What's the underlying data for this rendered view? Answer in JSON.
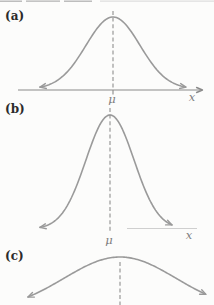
{
  "figure": {
    "background": "#fcfcfb",
    "curve_color": "#9a9a9a",
    "dash_color": "#8f8f8f",
    "axis_color": "#8a8a8a",
    "faint_axis_color": "#cfcfcf",
    "panel_label_color": "#2b2b2b",
    "symbol_color": "#7e7e7e",
    "top_crop_mark_color": "#b2b2b2",
    "top_crop_mark_faint_color": "#dedede"
  },
  "chart_data": {
    "type": "line",
    "title": "",
    "panels": [
      {
        "id": "a",
        "label": "(a)",
        "mu_label": "μ",
        "x_axis_label": "x",
        "relative_spread": "medium",
        "gauss": {
          "mean_x": 113,
          "sigma": 27,
          "peak_y": 17,
          "base_y": 89,
          "x_min": 40,
          "x_max": 186
        },
        "dashed": {
          "x": 113,
          "y1": 11,
          "y2": 90
        },
        "axis": {
          "x1": 18,
          "x2": 201,
          "y": 90,
          "tick_x": 113,
          "style": "solid",
          "arrow": true
        }
      },
      {
        "id": "b",
        "label": "(b)",
        "mu_label": "μ",
        "x_axis_label": "x",
        "relative_spread": "small (tall, narrow)",
        "gauss": {
          "mean_x": 110,
          "sigma": 24,
          "peak_y": 115,
          "base_y": 229,
          "x_min": 40,
          "x_max": 172
        },
        "dashed": {
          "x": 110,
          "y1": 108,
          "y2": 232
        },
        "axis": {
          "x1": 127,
          "x2": 197,
          "y": 228.5,
          "tick_x": null,
          "style": "faint",
          "arrow": false
        }
      },
      {
        "id": "c",
        "label": "(c)",
        "mu_label": "",
        "x_axis_label": "",
        "relative_spread": "large (low, wide; bottom cropped)",
        "gauss": {
          "mean_x": 120,
          "sigma": 56,
          "peak_y": 257,
          "base_y": 311,
          "x_min": 28,
          "x_max": 206
        },
        "dashed": {
          "x": 120,
          "y1": 262,
          "y2": 305
        },
        "axis": null
      }
    ]
  },
  "top_crop_marks": [
    {
      "x1": 0,
      "x2": 22,
      "faint": false
    },
    {
      "x1": 26,
      "x2": 60,
      "faint": false
    },
    {
      "x1": 64,
      "x2": 92,
      "faint": false
    },
    {
      "x1": 100,
      "x2": 214,
      "faint": true
    }
  ]
}
